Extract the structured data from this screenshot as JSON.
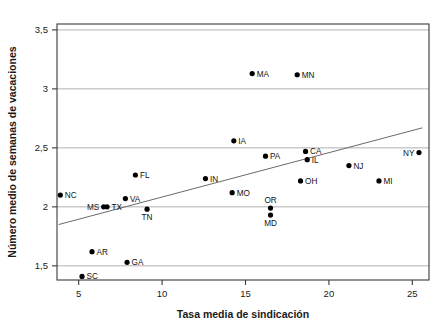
{
  "chart_data": {
    "type": "scatter",
    "title": "",
    "xlabel": "Tasa media de sindicación",
    "ylabel": "Número medio de semanas de vacaciones",
    "xlim": [
      3.7,
      26.0
    ],
    "ylim": [
      1.38,
      3.55
    ],
    "xticks": [
      5,
      10,
      15,
      20,
      25
    ],
    "xtick_labels": [
      "5",
      "10",
      "15",
      "20",
      "25"
    ],
    "yticks": [
      1.5,
      2.0,
      2.5,
      3.0,
      3.5
    ],
    "ytick_labels": [
      "1,5",
      "2",
      "2,5",
      "3",
      "3,5"
    ],
    "grid": "horizontal",
    "legend": "none",
    "points": [
      {
        "label": "NC",
        "x": 3.9,
        "y": 2.1,
        "label_pos": "right"
      },
      {
        "label": "MS",
        "x": 6.5,
        "y": 2.0,
        "label_pos": "left"
      },
      {
        "label": "TX",
        "x": 6.7,
        "y": 2.0,
        "label_pos": "right"
      },
      {
        "label": "VA",
        "x": 7.8,
        "y": 2.07,
        "label_pos": "right"
      },
      {
        "label": "FL",
        "x": 8.4,
        "y": 2.27,
        "label_pos": "right"
      },
      {
        "label": "TN",
        "x": 9.1,
        "y": 1.98,
        "label_pos": "below"
      },
      {
        "label": "AR",
        "x": 5.8,
        "y": 1.62,
        "label_pos": "right"
      },
      {
        "label": "SC",
        "x": 5.2,
        "y": 1.41,
        "label_pos": "right"
      },
      {
        "label": "GA",
        "x": 7.9,
        "y": 1.53,
        "label_pos": "right"
      },
      {
        "label": "IN",
        "x": 12.6,
        "y": 2.24,
        "label_pos": "right"
      },
      {
        "label": "MO",
        "x": 14.2,
        "y": 2.12,
        "label_pos": "right"
      },
      {
        "label": "IA",
        "x": 14.3,
        "y": 2.56,
        "label_pos": "right"
      },
      {
        "label": "MA",
        "x": 15.4,
        "y": 3.13,
        "label_pos": "right"
      },
      {
        "label": "PA",
        "x": 16.2,
        "y": 2.43,
        "label_pos": "right"
      },
      {
        "label": "OR",
        "x": 16.5,
        "y": 1.99,
        "label_pos": "above"
      },
      {
        "label": "MD",
        "x": 16.5,
        "y": 1.93,
        "label_pos": "below"
      },
      {
        "label": "MN",
        "x": 18.1,
        "y": 3.12,
        "label_pos": "right"
      },
      {
        "label": "OH",
        "x": 18.3,
        "y": 2.22,
        "label_pos": "right"
      },
      {
        "label": "CA",
        "x": 18.6,
        "y": 2.47,
        "label_pos": "right"
      },
      {
        "label": "IL",
        "x": 18.7,
        "y": 2.4,
        "label_pos": "right"
      },
      {
        "label": "NJ",
        "x": 21.2,
        "y": 2.35,
        "label_pos": "right"
      },
      {
        "label": "MI",
        "x": 23.0,
        "y": 2.22,
        "label_pos": "right"
      },
      {
        "label": "NY",
        "x": 25.4,
        "y": 2.46,
        "label_pos": "left"
      }
    ],
    "trendline": {
      "x0": 3.8,
      "y0": 1.85,
      "x1": 25.6,
      "y1": 2.67
    },
    "colors": {
      "point": "#000000",
      "trendline": "#6a6a6a",
      "gridline": "#a8a8a8",
      "axis": "#3a3a3a",
      "text": "#1a1a1a",
      "background": "#ffffff"
    }
  }
}
